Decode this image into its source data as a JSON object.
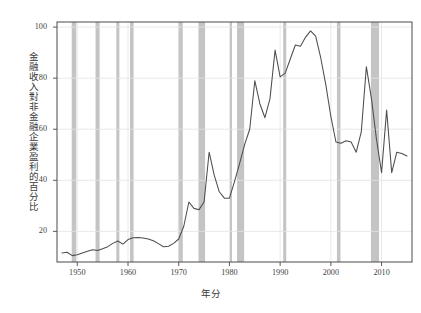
{
  "figure": {
    "background_color": "#ffffff",
    "plot_background_color": "#ffffff",
    "axis_color": "#4a4a4a",
    "grid_color": "#e3e3e8",
    "line_color": "#4d4d4d",
    "recession_band_color": "#c4c4c4"
  },
  "chart_data": {
    "type": "line",
    "title": "",
    "subtitle": "",
    "xlabel": "年分",
    "ylabel": "金融收入對非金融企業盈利的百分比",
    "xlim": [
      1946,
      2016
    ],
    "ylim": [
      8,
      102
    ],
    "grid": true,
    "legend": null,
    "xticks": [
      1950,
      1960,
      1970,
      1980,
      1990,
      2000,
      2010
    ],
    "xtick_labels": [
      "1950",
      "1960",
      "1970",
      "1980",
      "1990",
      "2000",
      "2010"
    ],
    "yticks": [
      20,
      40,
      60,
      80,
      100
    ],
    "ytick_labels": [
      "20",
      "40",
      "60",
      "80",
      "100"
    ],
    "series": [
      {
        "name": "金融收入對非金融企業盈利的百分比",
        "color": "#4d4d4d",
        "x": [
          1947,
          1948,
          1949,
          1950,
          1951,
          1952,
          1953,
          1954,
          1955,
          1956,
          1957,
          1958,
          1959,
          1960,
          1961,
          1962,
          1963,
          1964,
          1965,
          1966,
          1967,
          1968,
          1969,
          1970,
          1971,
          1972,
          1973,
          1974,
          1975,
          1976,
          1977,
          1978,
          1979,
          1980,
          1981,
          1982,
          1983,
          1984,
          1985,
          1986,
          1987,
          1988,
          1989,
          1990,
          1991,
          1992,
          1993,
          1994,
          1995,
          1996,
          1997,
          1998,
          1999,
          2000,
          2001,
          2002,
          2003,
          2004,
          2005,
          2006,
          2007,
          2008,
          2009,
          2010,
          2011,
          2012,
          2013,
          2014,
          2015
        ],
        "y": [
          11.5,
          11.8,
          10.5,
          10.8,
          11.5,
          12.2,
          12.8,
          12.5,
          13.2,
          14.0,
          15.3,
          16.2,
          15.0,
          16.8,
          17.5,
          17.6,
          17.4,
          17.0,
          16.3,
          15.2,
          14.0,
          14.2,
          15.3,
          17.0,
          22.0,
          31.5,
          29.0,
          28.5,
          31.5,
          51.0,
          42.0,
          35.5,
          33.0,
          33.0,
          39.5,
          46.5,
          54.0,
          60.0,
          79.0,
          70.0,
          64.5,
          72.0,
          91.0,
          80.5,
          82.0,
          87.5,
          93.0,
          92.5,
          96.0,
          98.5,
          96.5,
          88.0,
          77.5,
          65.0,
          55.0,
          54.5,
          55.5,
          55.0,
          51.0,
          59.0,
          84.5,
          72.0,
          56.0,
          43.0,
          67.5,
          43.0,
          51.0,
          50.5,
          49.5
        ],
        "y_trailing": [
          38.0,
          30.5,
          25.0,
          21.5,
          19.8,
          20.5,
          23.5
        ]
      }
    ],
    "recession_bands": [
      {
        "start": 1948.9,
        "end": 1949.8
      },
      {
        "start": 1953.6,
        "end": 1954.4
      },
      {
        "start": 1957.7,
        "end": 1958.3
      },
      {
        "start": 1960.4,
        "end": 1961.1
      },
      {
        "start": 1969.9,
        "end": 1970.8
      },
      {
        "start": 1973.9,
        "end": 1975.2
      },
      {
        "start": 1980.1,
        "end": 1980.5
      },
      {
        "start": 1981.5,
        "end": 1982.9
      },
      {
        "start": 1990.6,
        "end": 1991.2
      },
      {
        "start": 2001.2,
        "end": 2001.9
      },
      {
        "start": 2007.9,
        "end": 2009.5
      }
    ]
  }
}
